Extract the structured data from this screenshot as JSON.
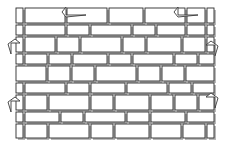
{
  "figure": {
    "type": "line-diagram",
    "width": 228,
    "height": 151,
    "background_color": "#ffffff",
    "stroke_color": "#2b2b2b",
    "shadow_color": "#b8b8b8",
    "fill_color": "#ffffff",
    "annotation_color": "#3a3a3a"
  },
  "wall": {
    "name": "wall-elevation",
    "bounds": {
      "x": 14,
      "y": 6,
      "width": 200,
      "height": 134
    },
    "shadow_offset": {
      "x": 2,
      "y": 2
    },
    "rows": [
      {
        "row_index": 0,
        "y": 8,
        "height": 15,
        "bricks": [
          {
            "x": 16,
            "width": 7
          },
          {
            "x": 25,
            "width": 40
          },
          {
            "x": 67,
            "width": 40
          },
          {
            "x": 109,
            "width": 34
          },
          {
            "x": 145,
            "width": 40
          },
          {
            "x": 187,
            "width": 18
          },
          {
            "x": 207,
            "width": 7
          }
        ]
      },
      {
        "row_index": 1,
        "y": 25,
        "height": 10,
        "bricks": [
          {
            "x": 16,
            "width": 7
          },
          {
            "x": 25,
            "width": 40
          },
          {
            "x": 67,
            "width": 22
          },
          {
            "x": 91,
            "width": 40
          },
          {
            "x": 133,
            "width": 22
          },
          {
            "x": 157,
            "width": 28
          },
          {
            "x": 187,
            "width": 18
          },
          {
            "x": 207,
            "width": 7
          }
        ]
      },
      {
        "row_index": 2,
        "y": 37,
        "height": 15,
        "bricks": [
          {
            "x": 16,
            "width": 7
          },
          {
            "x": 25,
            "width": 30
          },
          {
            "x": 57,
            "width": 22
          },
          {
            "x": 81,
            "width": 40
          },
          {
            "x": 123,
            "width": 22
          },
          {
            "x": 147,
            "width": 34
          },
          {
            "x": 183,
            "width": 22
          },
          {
            "x": 207,
            "width": 7
          }
        ]
      },
      {
        "row_index": 3,
        "y": 54,
        "height": 10,
        "bricks": [
          {
            "x": 16,
            "width": 7
          },
          {
            "x": 25,
            "width": 22
          },
          {
            "x": 49,
            "width": 22
          },
          {
            "x": 73,
            "width": 34
          },
          {
            "x": 109,
            "width": 22
          },
          {
            "x": 133,
            "width": 40
          },
          {
            "x": 175,
            "width": 22
          },
          {
            "x": 199,
            "width": 15
          }
        ]
      },
      {
        "row_index": 4,
        "y": 66,
        "height": 15,
        "bricks": [
          {
            "x": 16,
            "width": 30
          },
          {
            "x": 48,
            "width": 22
          },
          {
            "x": 72,
            "width": 22
          },
          {
            "x": 96,
            "width": 40
          },
          {
            "x": 138,
            "width": 22
          },
          {
            "x": 162,
            "width": 22
          },
          {
            "x": 186,
            "width": 28
          }
        ]
      },
      {
        "row_index": 5,
        "y": 83,
        "height": 10,
        "bricks": [
          {
            "x": 16,
            "width": 7
          },
          {
            "x": 25,
            "width": 40
          },
          {
            "x": 67,
            "width": 22
          },
          {
            "x": 91,
            "width": 34
          },
          {
            "x": 127,
            "width": 40
          },
          {
            "x": 169,
            "width": 22
          },
          {
            "x": 193,
            "width": 21
          }
        ]
      },
      {
        "row_index": 6,
        "y": 95,
        "height": 15,
        "bricks": [
          {
            "x": 16,
            "width": 7
          },
          {
            "x": 25,
            "width": 22
          },
          {
            "x": 49,
            "width": 40
          },
          {
            "x": 91,
            "width": 22
          },
          {
            "x": 115,
            "width": 34
          },
          {
            "x": 151,
            "width": 22
          },
          {
            "x": 175,
            "width": 22
          },
          {
            "x": 199,
            "width": 15
          }
        ]
      },
      {
        "row_index": 7,
        "y": 112,
        "height": 10,
        "bricks": [
          {
            "x": 16,
            "width": 7
          },
          {
            "x": 25,
            "width": 34
          },
          {
            "x": 61,
            "width": 22
          },
          {
            "x": 85,
            "width": 40
          },
          {
            "x": 127,
            "width": 22
          },
          {
            "x": 151,
            "width": 34
          },
          {
            "x": 187,
            "width": 27
          }
        ]
      },
      {
        "row_index": 8,
        "y": 124,
        "height": 14,
        "bricks": [
          {
            "x": 16,
            "width": 7
          },
          {
            "x": 25,
            "width": 22
          },
          {
            "x": 49,
            "width": 40
          },
          {
            "x": 91,
            "width": 22
          },
          {
            "x": 115,
            "width": 34
          },
          {
            "x": 151,
            "width": 30
          },
          {
            "x": 183,
            "width": 22
          },
          {
            "x": 207,
            "width": 7
          }
        ]
      }
    ]
  },
  "annotations": [
    {
      "id": "leader-top-left",
      "name": "annotation-arrow-top-left",
      "description": "hook leader pointing down-left at upper course joint",
      "anchor": {
        "x": 64,
        "y": 6
      },
      "direction": "down-left"
    },
    {
      "id": "leader-top-right",
      "name": "annotation-arrow-top-right",
      "description": "hook leader pointing down-left at upper right course",
      "anchor": {
        "x": 176,
        "y": 6
      },
      "direction": "down-left"
    },
    {
      "id": "leader-left-upper",
      "name": "annotation-arrow-left-upper",
      "description": "hook leader pointing right at left edge quoin",
      "anchor": {
        "x": 12,
        "y": 40
      },
      "direction": "right"
    },
    {
      "id": "leader-right-upper",
      "name": "annotation-arrow-right-upper",
      "description": "hook leader pointing left at right edge quoin",
      "anchor": {
        "x": 214,
        "y": 42
      },
      "direction": "left"
    },
    {
      "id": "leader-left-lower",
      "name": "annotation-arrow-left-lower",
      "description": "hook leader pointing right at lower left quoin",
      "anchor": {
        "x": 12,
        "y": 98
      },
      "direction": "right"
    },
    {
      "id": "leader-right-lower",
      "name": "annotation-arrow-right-lower",
      "description": "hook leader pointing left at lower right quoin",
      "anchor": {
        "x": 214,
        "y": 94
      },
      "direction": "left"
    }
  ]
}
